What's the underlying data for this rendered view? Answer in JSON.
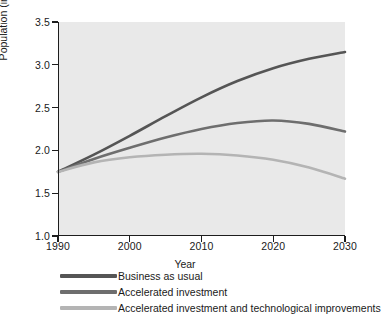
{
  "chart_data": {
    "type": "line",
    "title": "",
    "xlabel": "Year",
    "ylabel": "Population (in billions)",
    "xlim": [
      1990,
      2030
    ],
    "ylim": [
      1.0,
      3.5
    ],
    "xticks": [
      "1990",
      "2000",
      "2010",
      "2020",
      "2030"
    ],
    "yticks": [
      "1.0",
      "1.5",
      "2.0",
      "2.5",
      "3.0",
      "3.5"
    ],
    "grid": false,
    "legend_position": "below-axis-left",
    "plot_background": "#e9e9e9",
    "x": [
      1990,
      1995,
      2000,
      2005,
      2010,
      2015,
      2020,
      2025,
      2030
    ],
    "series": [
      {
        "name": "Business as usual",
        "color": "#555555",
        "values": [
          1.75,
          1.95,
          2.17,
          2.4,
          2.62,
          2.81,
          2.96,
          3.07,
          3.15
        ]
      },
      {
        "name": "Accelerated investment",
        "color": "#6e6e6e",
        "values": [
          1.75,
          1.9,
          2.03,
          2.15,
          2.25,
          2.32,
          2.35,
          2.31,
          2.22
        ]
      },
      {
        "name": "Accelerated investment and technological improvements",
        "color": "#b4b4b4",
        "values": [
          1.75,
          1.86,
          1.92,
          1.95,
          1.96,
          1.94,
          1.89,
          1.8,
          1.67
        ]
      }
    ]
  }
}
